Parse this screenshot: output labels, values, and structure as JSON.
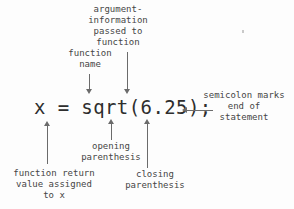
{
  "diagram": {
    "code": "x = sqrt(6.25);",
    "ink_color": "#3a3a3a",
    "arrow_color": "#6b6b6b",
    "background_color": "#fdfdfd"
  },
  "annotations": {
    "argument": {
      "text": "argument-\ninformation\npassed to\nfunction",
      "points_to": "6.25",
      "arrow": "down"
    },
    "function_name": {
      "text": "function\nname",
      "points_to": "sqrt",
      "arrow": "down"
    },
    "semicolon": {
      "text": "semicolon marks\nend of\nstatement",
      "points_to": ";",
      "arrow": "left"
    },
    "opening_paren": {
      "text": "opening\nparenthesis",
      "points_to": "(",
      "arrow": "up"
    },
    "closing_paren": {
      "text": "closing\nparenthesis",
      "points_to": ")",
      "arrow": "up"
    },
    "return_value": {
      "text": "function return\nvalue assigned\nto x",
      "points_to": "x",
      "arrow": "up"
    }
  }
}
